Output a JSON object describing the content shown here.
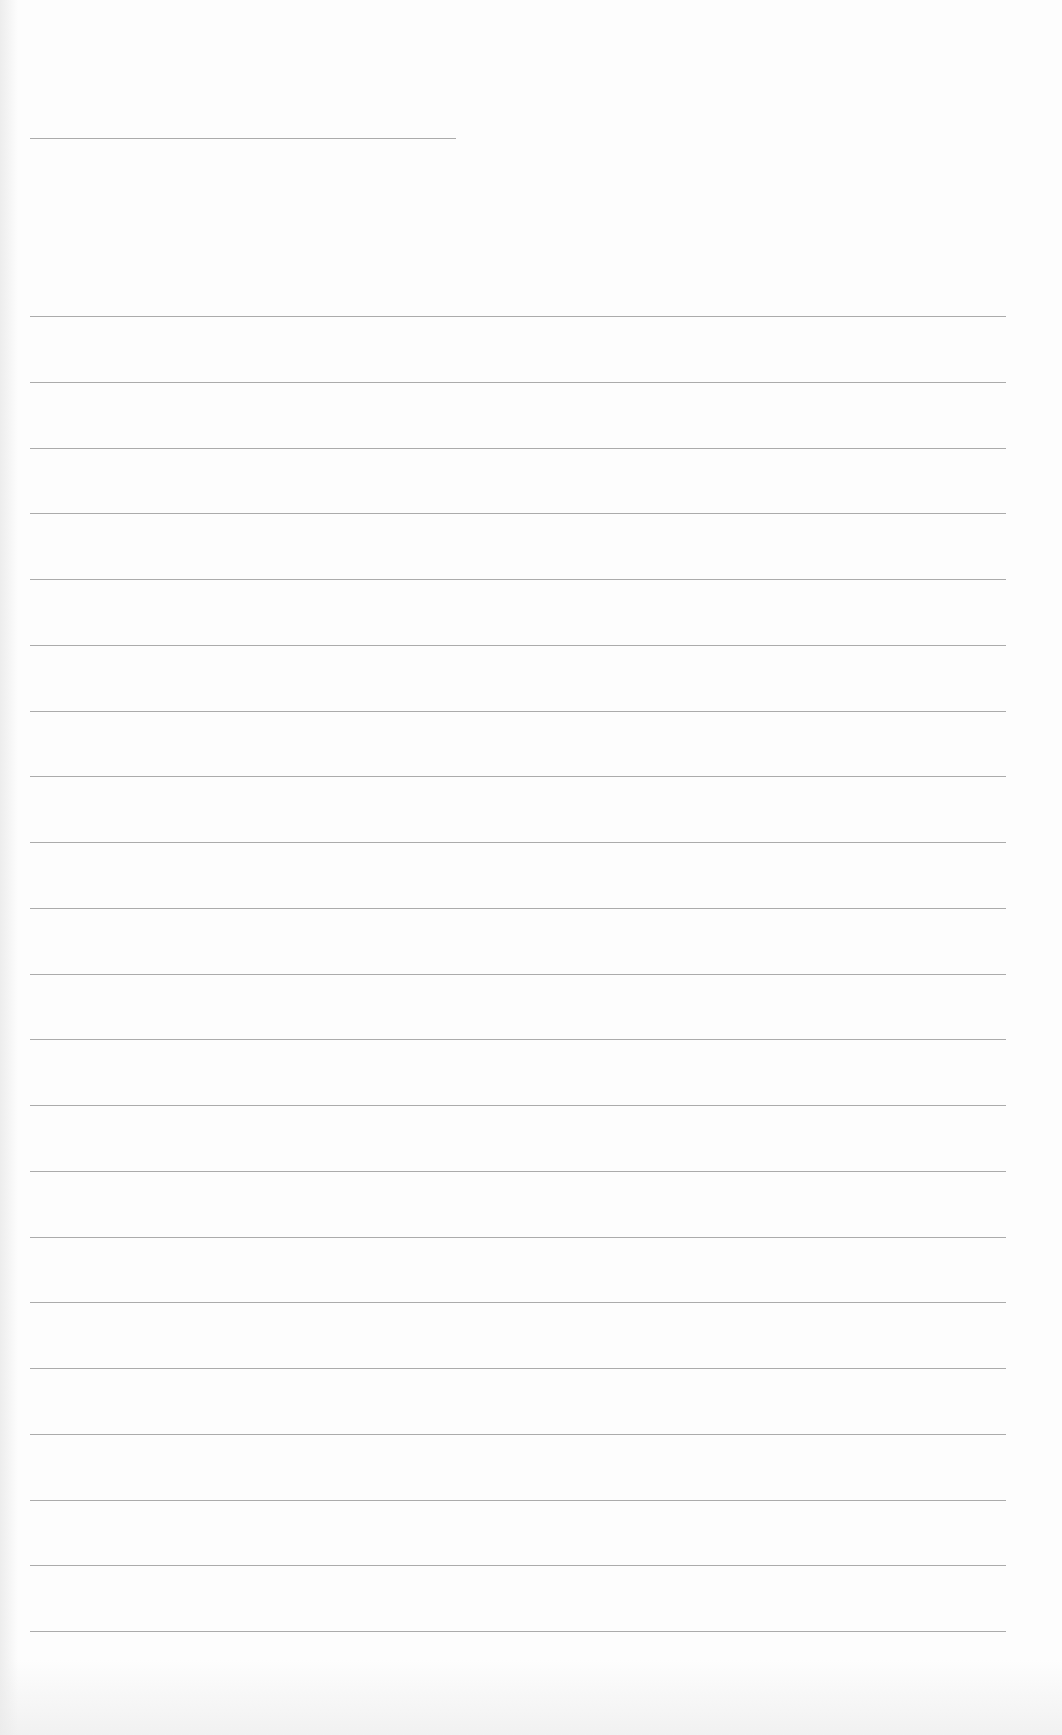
{
  "page": {
    "type": "blank lined paper",
    "background_color": "#fdfdfd",
    "line_color": "#9c9c9c"
  },
  "header_rule": {
    "y": 138,
    "x_start": 30,
    "x_end": 456
  },
  "ruled_lines": {
    "count": 21,
    "first_y": 316,
    "spacing": 65.75,
    "x_start": 30,
    "x_end": 1006
  }
}
